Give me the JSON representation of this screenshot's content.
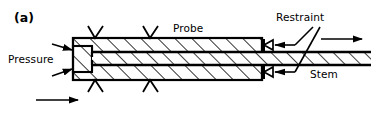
{
  "figure": {
    "panel_label": "(a)",
    "type": "engineering-schematic",
    "colors": {
      "line": "#000000",
      "background": "#ffffff",
      "hatch": "#000000"
    }
  },
  "labels": {
    "pressure": "Pressure",
    "probe": "Probe",
    "restraint": "Restraint",
    "stem": "Stem"
  },
  "icons": {
    "pressure_arrow": "arrow-right-icon",
    "motion_arrow": "arrow-right-icon",
    "restraint_symbol": "triangle-restraint-icon",
    "support_chevron": "chevron-support-icon",
    "leader_line": "leader-line-icon"
  },
  "geometry": {
    "probe_body": {
      "x": 73,
      "y": 38,
      "width": 189,
      "height": 42
    },
    "stem_inside": {
      "x": 92,
      "y": 52,
      "width": 170,
      "height": 13
    },
    "stem_outside": {
      "x": 262,
      "y": 52,
      "width": 109,
      "height": 13
    },
    "hatch_angle_deg": 45,
    "hatch_spacing": 12
  },
  "annotations": {
    "pressure_arrow_count": 2,
    "top_support_count": 2,
    "bottom_support_count": 2,
    "restraint_symbol_count": 2,
    "motion_arrow_count": 2
  }
}
